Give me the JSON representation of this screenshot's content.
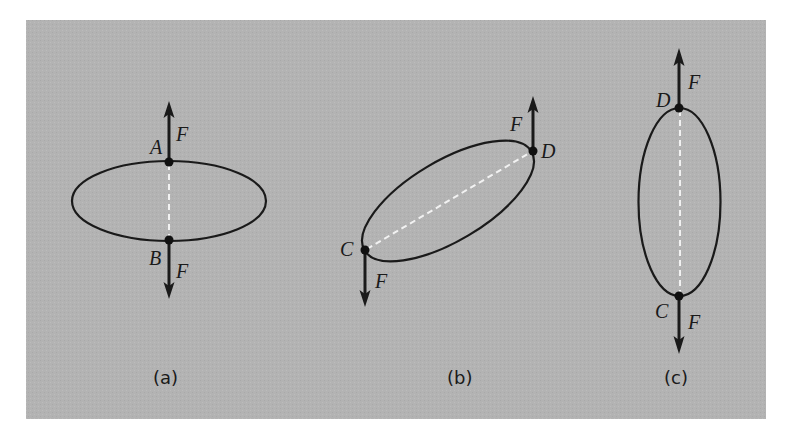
{
  "figure": {
    "background_color": "#b3b3b3",
    "page_color": "#ffffff",
    "stroke_color": "#1a1a1a",
    "chord_color": "#f2f2f2",
    "panels": [
      {
        "id": "a",
        "caption": "(a)",
        "ellipse": {
          "cx": 169,
          "cy": 201,
          "rx": 97,
          "ry": 40,
          "rotation_deg": 0
        },
        "points": [
          {
            "label": "A",
            "x": 169,
            "y": 162,
            "force_label": "F",
            "force_direction": "up"
          },
          {
            "label": "B",
            "x": 169,
            "y": 240,
            "force_label": "F",
            "force_direction": "down"
          }
        ]
      },
      {
        "id": "b",
        "caption": "(b)",
        "ellipse": {
          "cx": 448,
          "cy": 201,
          "rx": 97,
          "ry": 40,
          "rotation_deg": -30.7
        },
        "points": [
          {
            "label": "D",
            "x": 533,
            "y": 151,
            "force_label": "F",
            "force_direction": "up"
          },
          {
            "label": "C",
            "x": 365,
            "y": 250,
            "force_label": "F",
            "force_direction": "down"
          }
        ]
      },
      {
        "id": "c",
        "caption": "(c)",
        "ellipse": {
          "cx": 679,
          "cy": 202,
          "rx": 41,
          "ry": 94,
          "rotation_deg": 0
        },
        "points": [
          {
            "label": "D",
            "x": 679,
            "y": 108,
            "force_label": "F",
            "force_direction": "up"
          },
          {
            "label": "C",
            "x": 679,
            "y": 296,
            "force_label": "F",
            "force_direction": "down"
          }
        ]
      }
    ]
  }
}
